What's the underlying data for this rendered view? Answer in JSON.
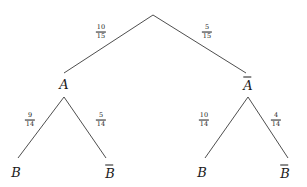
{
  "figure": {
    "type": "probability-tree-diagram",
    "background_color": "#ffffff",
    "line_color": "#3a3a3a",
    "text_color": "#1a1a1a"
  },
  "nodes": {
    "root": {
      "label": "",
      "x": 153,
      "y": 14
    },
    "level1": [
      {
        "id": "A",
        "label": "A",
        "overline": false,
        "x": 64,
        "y": 84
      },
      {
        "id": "Abar",
        "label": "A",
        "overline": true,
        "x": 248,
        "y": 84
      }
    ],
    "level2": [
      {
        "id": "B-left",
        "label": "B",
        "overline": false,
        "x": 16,
        "y": 172
      },
      {
        "id": "Bbar-left",
        "label": "B",
        "overline": true,
        "x": 110,
        "y": 172
      },
      {
        "id": "B-right",
        "label": "B",
        "overline": false,
        "x": 202,
        "y": 172
      },
      {
        "id": "Bbar-right",
        "label": "B",
        "overline": true,
        "x": 285,
        "y": 172
      }
    ]
  },
  "edges": [
    {
      "id": "root-to-A",
      "from": "root",
      "to": "A",
      "x1": 153,
      "y1": 15,
      "x2": 64,
      "y2": 73,
      "label": {
        "numerator": "10",
        "denominator": "15",
        "x": 101,
        "y": 32
      }
    },
    {
      "id": "root-to-Abar",
      "from": "root",
      "to": "Abar",
      "x1": 153,
      "y1": 15,
      "x2": 246,
      "y2": 73,
      "label": {
        "numerator": "5",
        "denominator": "15",
        "x": 207,
        "y": 32
      }
    },
    {
      "id": "A-to-B",
      "from": "A",
      "to": "B-left",
      "x1": 64,
      "y1": 97,
      "x2": 18,
      "y2": 158,
      "label": {
        "numerator": "9",
        "denominator": "14",
        "x": 30,
        "y": 120
      }
    },
    {
      "id": "A-to-Bbar",
      "from": "A",
      "to": "Bbar-left",
      "x1": 64,
      "y1": 97,
      "x2": 106,
      "y2": 158,
      "label": {
        "numerator": "5",
        "denominator": "14",
        "x": 101,
        "y": 120
      }
    },
    {
      "id": "Abar-to-B",
      "from": "Abar",
      "to": "B-right",
      "x1": 248,
      "y1": 97,
      "x2": 205,
      "y2": 158,
      "label": {
        "numerator": "10",
        "denominator": "14",
        "x": 204,
        "y": 120
      }
    },
    {
      "id": "Abar-to-Bbar",
      "from": "Abar",
      "to": "Bbar-right",
      "x1": 248,
      "y1": 97,
      "x2": 288,
      "y2": 158,
      "label": {
        "numerator": "4",
        "denominator": "14",
        "x": 276,
        "y": 120
      }
    }
  ]
}
